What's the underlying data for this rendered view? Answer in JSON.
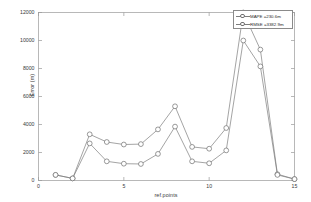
{
  "chart_data": {
    "type": "line",
    "title": "",
    "xlabel": "ref.points",
    "ylabel": "Error (m)",
    "xlim": [
      0,
      15
    ],
    "ylim": [
      0,
      12000
    ],
    "xticks": [
      0,
      5,
      10,
      15
    ],
    "yticks": [
      0,
      2000,
      4000,
      6000,
      8000,
      10000,
      12000
    ],
    "xtick_labels": [
      "0",
      "5",
      "10",
      "15"
    ],
    "ytick_labels": [
      "0",
      "2000",
      "4000",
      "6000",
      "8000",
      "10000",
      "12000"
    ],
    "grid": false,
    "legend_position": "top-right",
    "marker": "circle",
    "x": [
      1,
      2,
      3,
      4,
      5,
      6,
      7,
      8,
      9,
      10,
      11,
      12,
      13,
      14,
      15
    ],
    "series": [
      {
        "name": "MAPE =230.6m",
        "legend_label": "MAPE =230.6m",
        "color": "#7d7d7d",
        "values": [
          400,
          150,
          3300,
          2750,
          2570,
          2600,
          3650,
          5300,
          2400,
          2270,
          3750,
          12000,
          9350,
          450,
          100
        ]
      },
      {
        "name": "RMSE =3382.9m",
        "legend_label": "RMSE =3382.9m",
        "color": "#7d7d7d",
        "values": [
          400,
          150,
          2650,
          1370,
          1200,
          1180,
          1900,
          3850,
          1370,
          1230,
          2150,
          10000,
          8150,
          400,
          100
        ]
      }
    ]
  },
  "axes": {
    "y_title": "Error (m)",
    "x_title": "ref.points"
  },
  "legend": {
    "items": [
      {
        "label": "MAPE =230.6m"
      },
      {
        "label": "RMSE =3382.9m"
      }
    ]
  }
}
